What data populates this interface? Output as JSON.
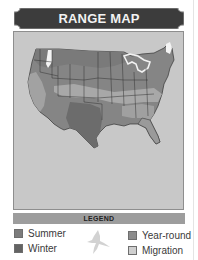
{
  "header": {
    "title": "RANGE MAP"
  },
  "map": {
    "region": "United States",
    "icon": "us-map-icon",
    "colors": {
      "background": "#c8c8c8",
      "summer": "#7a7a7a",
      "winter": "#6a6a6a",
      "year_round": "#8a8a8a",
      "migration": "#b8b8b8",
      "water": "#ffffff"
    }
  },
  "legend": {
    "title": "LEGEND",
    "items": [
      {
        "label": "Summer",
        "color": "#7c7c7c"
      },
      {
        "label": "Winter",
        "color": "#636363"
      },
      {
        "label": "Year-round",
        "color": "#8c8c8c"
      },
      {
        "label": "Migration",
        "color": "#cfcfcf"
      }
    ],
    "icon": "bird-silhouette-icon"
  }
}
